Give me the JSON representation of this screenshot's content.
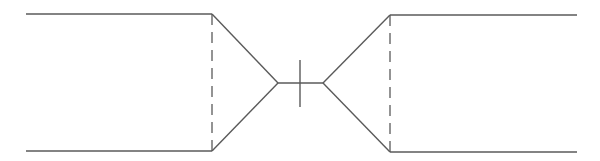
{
  "diagram": {
    "title": "",
    "stroke_color": "#5a5a5a",
    "background": "#ffffff",
    "elements": {
      "left_top_line": {
        "x1": 26,
        "y1": 14,
        "x2": 212,
        "y2": 14
      },
      "left_bottom_line": {
        "x1": 26,
        "y1": 151,
        "x2": 212,
        "y2": 151
      },
      "left_dashed_line": {
        "x1": 212,
        "y1": 14,
        "x2": 212,
        "y2": 151
      },
      "left_taper_top": {
        "x1": 212,
        "y1": 14,
        "x2": 278,
        "y2": 83
      },
      "left_taper_bottom": {
        "x1": 212,
        "y1": 151,
        "x2": 278,
        "y2": 83
      },
      "center_line": {
        "x1": 278,
        "y1": 83,
        "x2": 323,
        "y2": 83
      },
      "center_tick": {
        "x1": 300,
        "y1": 60,
        "x2": 300,
        "y2": 107
      },
      "right_taper_top": {
        "x1": 323,
        "y1": 83,
        "x2": 390,
        "y2": 15
      },
      "right_taper_bottom": {
        "x1": 323,
        "y1": 83,
        "x2": 390,
        "y2": 152
      },
      "right_dashed_line": {
        "x1": 390,
        "y1": 15,
        "x2": 390,
        "y2": 152
      },
      "right_top_line": {
        "x1": 390,
        "y1": 15,
        "x2": 577,
        "y2": 15
      },
      "right_bottom_line": {
        "x1": 390,
        "y1": 152,
        "x2": 577,
        "y2": 152
      }
    }
  }
}
